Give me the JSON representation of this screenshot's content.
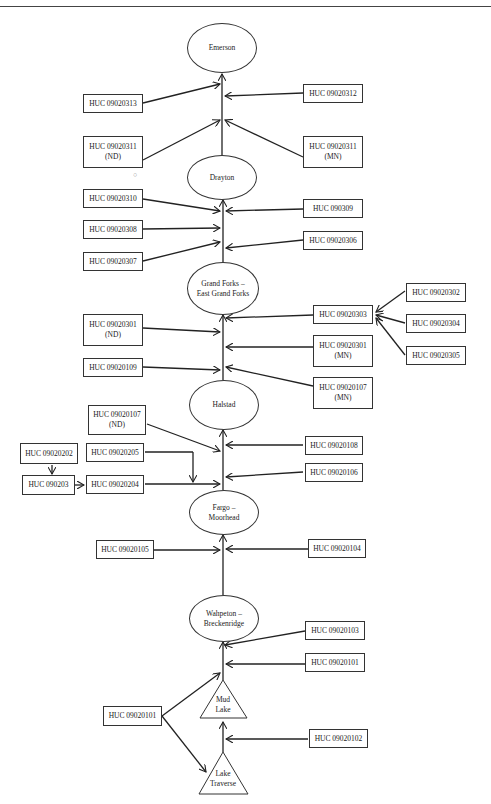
{
  "nodes": {
    "emerson": "Emerson",
    "drayton": "Drayton",
    "grand_forks_1": "Grand Forks –",
    "grand_forks_2": "East Grand Forks",
    "halstad": "Halstad",
    "fargo_1": "Fargo –",
    "fargo_2": "Moorhead",
    "wahpeton_1": "Wahpeton –",
    "wahpeton_2": "Breckenridge",
    "mud_lake_1": "Mud",
    "mud_lake_2": "Lake",
    "lake_traverse_1": "Lake",
    "lake_traverse_2": "Traverse"
  },
  "boxes": {
    "b313": "HUC 09020313",
    "b312": "HUC 09020312",
    "b311nd_1": "HUC 09020311",
    "b311nd_2": "(ND)",
    "b311mn_1": "HUC 09020311",
    "b311mn_2": "(MN)",
    "b310": "HUC 09020310",
    "b309": "HUC 090309",
    "b308": "HUC 09020308",
    "b306": "HUC 09020306",
    "b307": "HUC 09020307",
    "b303": "HUC 09020303",
    "b302": "HUC 09020302",
    "b304": "HUC 09020304",
    "b305": "HUC 09020305",
    "b301nd_1": "HUC 09020301",
    "b301nd_2": "(ND)",
    "b301mn_1": "HUC 09020301",
    "b301mn_2": "(MN)",
    "b109": "HUC 09020109",
    "b107mn_1": "HUC 09020107",
    "b107mn_2": "(MN)",
    "b107nd_1": "HUC 09020107",
    "b107nd_2": "(ND)",
    "b108": "HUC 09020108",
    "b202": "HUC 09020202",
    "b205": "HUC 09020205",
    "b106": "HUC 09020106",
    "b203": "HUC 090203",
    "b204": "HUC 09020204",
    "b105": "HUC 09020105",
    "b104": "HUC 09020104",
    "b103": "HUC 09020103",
    "b101a": "HUC 09020101",
    "b101b": "HUC 09020101",
    "b102": "HUC 09020102"
  }
}
